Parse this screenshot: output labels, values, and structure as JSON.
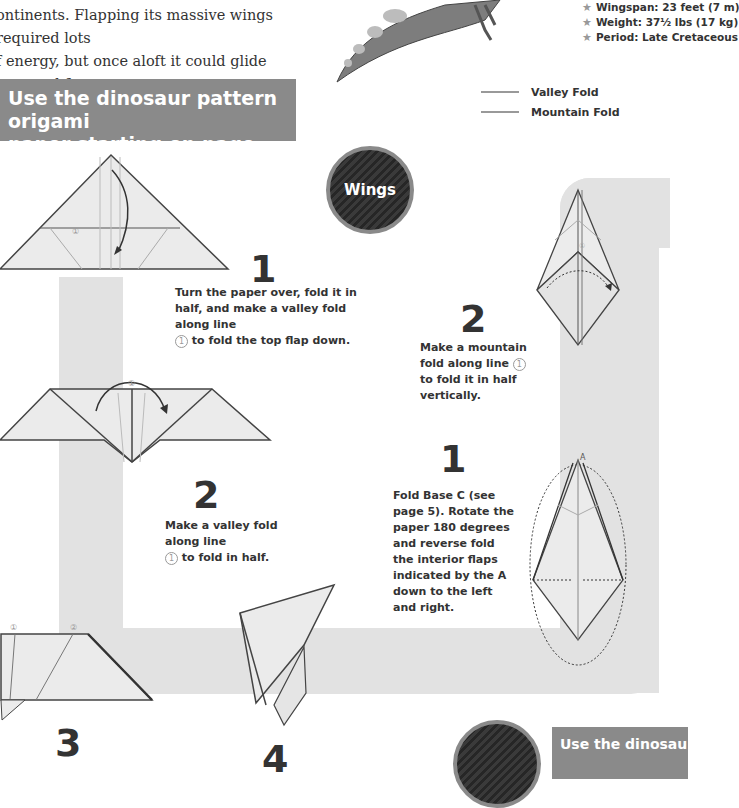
{
  "intro": {
    "line1": "ontinents. Flapping its massive wings required lots",
    "line2": "f energy, but once aloft it could glide long and far."
  },
  "facts": [
    {
      "icon": "star-icon",
      "text": "Wingspan: 23 feet (7 m)"
    },
    {
      "icon": "star-icon",
      "text": "Weight: 37½ lbs (17 kg)"
    },
    {
      "icon": "star-icon",
      "text": "Period: Late Cretaceous"
    }
  ],
  "legend": [
    {
      "label": "Valley Fold",
      "color": "#999999"
    },
    {
      "label": "Mountain Fold",
      "color": "#999999"
    }
  ],
  "banner_top": {
    "line1": "Use the dinosaur pattern origami",
    "line2": "paper starting on page 79!"
  },
  "banner_bottom": {
    "text": "Use the dinosau"
  },
  "section_badge": {
    "label": "Wings"
  },
  "left_steps": [
    {
      "number": "1",
      "pre": "Turn the paper over, fold it in half, and make a valley fold along line",
      "marker": "1",
      "post": "to fold the top flap down."
    },
    {
      "number": "2",
      "pre": "Make a valley fold along line",
      "marker": "1",
      "post": "to fold in half."
    },
    {
      "number": "3"
    },
    {
      "number": "4"
    }
  ],
  "right_steps": [
    {
      "number": "1",
      "text": "Fold Base C (see page 5). Rotate the paper 180 degrees and reverse fold the interior flaps indicated by the A down to the left and right."
    },
    {
      "number": "2",
      "pre": "Make a mountain fold along line",
      "marker": "1",
      "post": "to fold it in half vertically."
    }
  ],
  "diagram_labels": {
    "circled_1": "①",
    "circled_2": "②",
    "point_a": "A"
  },
  "colors": {
    "banner": "#8a8a8a",
    "band": "#e2e2e2",
    "text": "#333333",
    "paper": "#e9e9e9"
  }
}
